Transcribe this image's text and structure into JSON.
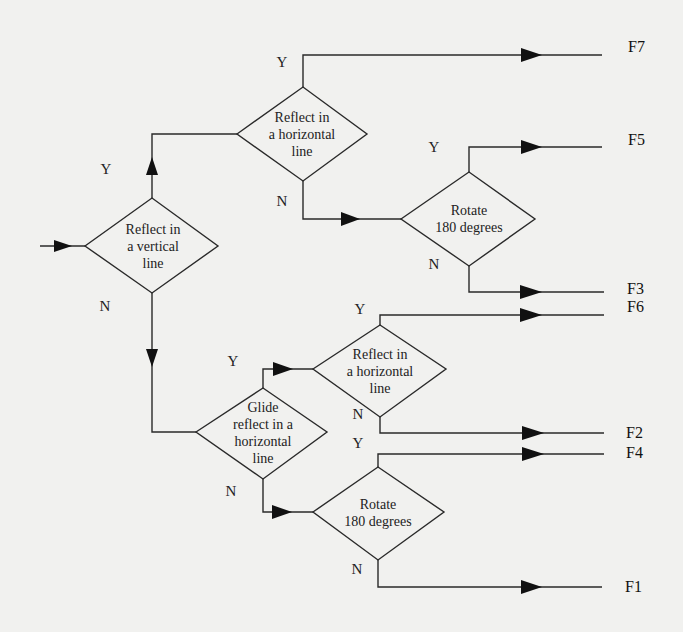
{
  "diagram": {
    "type": "flowchart",
    "nodes": [
      {
        "id": "d1",
        "label": "Reflect in\na vertical\nline"
      },
      {
        "id": "d2",
        "label": "Reflect in\na horizontal\nline"
      },
      {
        "id": "d3",
        "label": "Rotate\n180 degrees"
      },
      {
        "id": "d4",
        "label": "Glide\nreflect in a\nhorizontal\nline"
      },
      {
        "id": "d5",
        "label": "Reflect in\na horizontal\nline"
      },
      {
        "id": "d6",
        "label": "Rotate\n180 degrees"
      }
    ],
    "branch_labels": {
      "d1_yes": "Y",
      "d1_no": "N",
      "d2_yes": "Y",
      "d2_no": "N",
      "d3_yes": "Y",
      "d3_no": "N",
      "d4_yes": "Y",
      "d4_no": "N",
      "d5_yes": "Y",
      "d5_no": "N",
      "d6_yes": "Y",
      "d6_no": "N"
    },
    "outcomes": {
      "f7": "F7",
      "f5": "F5",
      "f3": "F3",
      "f6": "F6",
      "f2": "F2",
      "f4": "F4",
      "f1": "F1"
    },
    "edges": [
      {
        "from": "start",
        "to": "d1"
      },
      {
        "from": "d1",
        "to": "d2",
        "label": "Y"
      },
      {
        "from": "d1",
        "to": "d4",
        "label": "N"
      },
      {
        "from": "d2",
        "to": "F7",
        "label": "Y"
      },
      {
        "from": "d2",
        "to": "d3",
        "label": "N"
      },
      {
        "from": "d3",
        "to": "F5",
        "label": "Y"
      },
      {
        "from": "d3",
        "to": "F3",
        "label": "N"
      },
      {
        "from": "d4",
        "to": "d5",
        "label": "Y"
      },
      {
        "from": "d4",
        "to": "d6",
        "label": "N"
      },
      {
        "from": "d5",
        "to": "F6",
        "label": "Y"
      },
      {
        "from": "d5",
        "to": "F2",
        "label": "N"
      },
      {
        "from": "d6",
        "to": "F4",
        "label": "Y"
      },
      {
        "from": "d6",
        "to": "F1",
        "label": "N"
      }
    ],
    "colors": {
      "line": "#2a2a2a",
      "background": "#f1f1ef"
    }
  }
}
